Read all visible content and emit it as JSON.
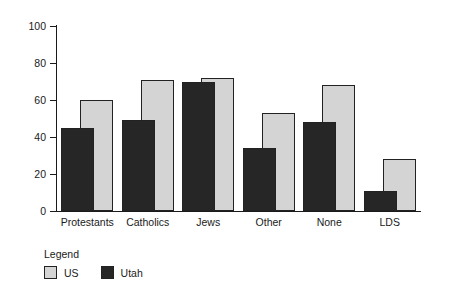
{
  "chart_data": {
    "type": "bar",
    "title": "",
    "subtitle": "",
    "xlabel": "",
    "ylabel": "",
    "ylim": [
      0,
      100
    ],
    "yticks": [
      0,
      20,
      40,
      60,
      80,
      100
    ],
    "grid": false,
    "legend_position": "below-left",
    "legend_title": "Legend",
    "categories": [
      "Protestants",
      "Catholics",
      "Jews",
      "Other",
      "None",
      "LDS"
    ],
    "series": [
      {
        "name": "US",
        "color": "#d4d4d4",
        "values": [
          60,
          71,
          72,
          53,
          68,
          28
        ]
      },
      {
        "name": "Utah",
        "color": "#262626",
        "values": [
          45,
          49,
          70,
          34,
          48,
          11
        ]
      }
    ]
  },
  "legend": {
    "title": "Legend",
    "items": [
      {
        "label": "US",
        "swatch": "us"
      },
      {
        "label": "Utah",
        "swatch": "utah"
      }
    ]
  },
  "axis": {
    "y_tick_labels": [
      "100",
      "80",
      "60",
      "40",
      "20",
      "0"
    ]
  }
}
